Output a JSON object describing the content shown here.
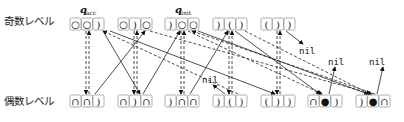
{
  "labels": {
    "odd_level": "奇数レベル",
    "even_level": "偶数レベル",
    "q_acc": "q",
    "q_acc_sub": "acc",
    "q_init": "q",
    "q_init_sub": "init",
    "nil": "nil"
  },
  "odd_row": [
    {
      "cells": [
        "○",
        "○",
        ")"
      ]
    },
    {
      "cells": [
        "○",
        ")",
        "○"
      ]
    },
    {
      "cells": [
        ")",
        "○",
        "○"
      ]
    },
    {
      "cells": [
        ")",
        "(",
        ")"
      ]
    },
    {
      "cells": [
        "(",
        ")",
        ")"
      ]
    }
  ],
  "even_row": [
    {
      "cells": [
        "∩",
        "∩",
        ")"
      ]
    },
    {
      "cells": [
        "∩",
        ")",
        "∩"
      ]
    },
    {
      "cells": [
        ")",
        "∩",
        "∩"
      ]
    },
    {
      "cells": [
        ")",
        "(",
        ")"
      ]
    },
    {
      "cells": [
        "(",
        ")",
        ")"
      ]
    },
    {
      "cells": [
        "∩",
        "●",
        ")"
      ]
    },
    {
      "cells": [
        ")",
        "●",
        "∩"
      ]
    }
  ]
}
